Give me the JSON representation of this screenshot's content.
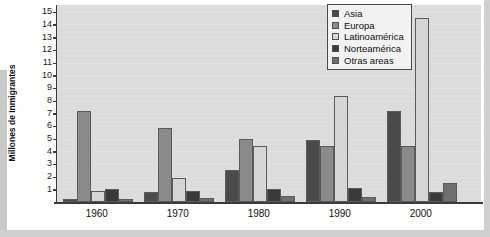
{
  "chart_data": {
    "type": "bar",
    "title": "",
    "subtitle": "",
    "xlabel": "",
    "ylabel": "Millones de Inmigrantes",
    "categories": [
      "1960",
      "1970",
      "1980",
      "1990",
      "2000"
    ],
    "ylim": [
      0,
      15
    ],
    "yticks": [
      1,
      2,
      3,
      4,
      5,
      6,
      7,
      8,
      9,
      10,
      11,
      12,
      13,
      14,
      15
    ],
    "grid": false,
    "legend_position": "top-right",
    "series": [
      {
        "name": "Asia",
        "color": "#4a4a4a",
        "values": [
          0.2,
          0.8,
          2.5,
          4.9,
          7.2
        ]
      },
      {
        "name": "Europa",
        "color": "#8a8a8a",
        "values": [
          7.2,
          5.8,
          5.0,
          4.4,
          4.4
        ]
      },
      {
        "name": "Latinoamérica",
        "color": "#d6d6d6",
        "values": [
          0.9,
          1.9,
          4.4,
          8.4,
          14.5
        ]
      },
      {
        "name": "Norteamérica",
        "color": "#3a3a3a",
        "values": [
          1.0,
          0.9,
          1.0,
          1.1,
          0.8
        ]
      },
      {
        "name": "Otras areas",
        "color": "#6f6f6f",
        "values": [
          0.2,
          0.3,
          0.5,
          0.4,
          1.5
        ]
      }
    ]
  },
  "legend": {
    "items": [
      {
        "label": "Asia"
      },
      {
        "label": "Europa"
      },
      {
        "label": "Latinoamérica"
      },
      {
        "label": "Norteamérica"
      },
      {
        "label": "Otras areas"
      }
    ]
  },
  "colors": {
    "plot_background": "#dcdcdc",
    "axis": "#3b3b3b",
    "legend_background": "#f2f2f2"
  }
}
